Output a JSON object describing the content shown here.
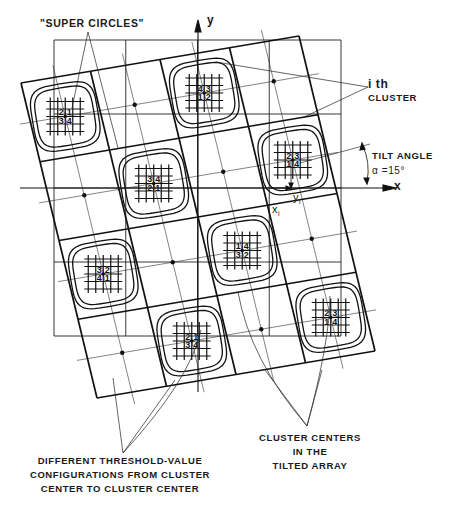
{
  "labels": {
    "super_circles": "\"SUPER CIRCLES\"",
    "ith_cluster_line1": "i th",
    "ith_cluster_line2": "CLUSTER",
    "tilt_angle": "TILT ANGLE",
    "alpha": "α =15°",
    "x_axis": "x",
    "y_axis": "y",
    "xi": "x",
    "xi_sub": "i",
    "yi": "y",
    "yi_sub": "i",
    "different_line1": "DIFFERENT THRESHOLD-VALUE",
    "different_line2": "CONFIGURATIONS FROM CLUSTER",
    "different_line3": "CENTER TO CLUSTER CENTER",
    "centers_line1": "CLUSTER CENTERS",
    "centers_line2": "IN THE",
    "centers_line3": "TILTED ARRAY"
  },
  "geometry": {
    "tilt_angle_deg": 15,
    "tilted_array": {
      "rows": 4,
      "cols": 4
    },
    "square_grid": {
      "rows": 4,
      "cols": 4
    }
  },
  "clusters": [
    {
      "row": 0,
      "col": 0,
      "values": [
        "2",
        "1",
        "3",
        "4"
      ]
    },
    {
      "row": 0,
      "col": 2,
      "values": [
        "4",
        "3",
        "1",
        "2"
      ]
    },
    {
      "row": 1,
      "col": 1,
      "values": [
        "3",
        "4",
        "2",
        "1"
      ]
    },
    {
      "row": 1,
      "col": 3,
      "values": [
        "2",
        "3",
        "1",
        "4"
      ]
    },
    {
      "row": 2,
      "col": 0,
      "values": [
        "3",
        "2",
        "4",
        "1"
      ]
    },
    {
      "row": 2,
      "col": 2,
      "values": [
        "1",
        "4",
        "3",
        "2"
      ]
    },
    {
      "row": 3,
      "col": 1,
      "values": [
        "2",
        "1",
        "3",
        "4"
      ]
    },
    {
      "row": 3,
      "col": 3,
      "values": [
        "2",
        "3",
        "1",
        "4"
      ]
    }
  ]
}
